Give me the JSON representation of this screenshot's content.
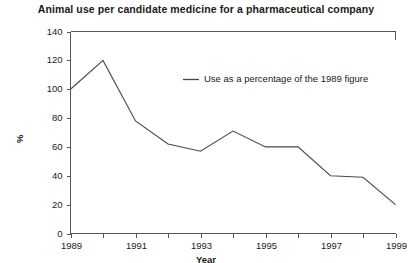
{
  "chart_data": {
    "type": "line",
    "title": "Animal use per candidate medicine for a pharmaceutical company",
    "xlabel": "Year",
    "ylabel": "%",
    "x": [
      1989,
      1990,
      1991,
      1992,
      1993,
      1994,
      1995,
      1996,
      1997,
      1998,
      1999
    ],
    "series": [
      {
        "name": "Use as a percentage of the 1989 figure",
        "values": [
          100,
          120,
          78,
          62,
          57,
          71,
          60,
          60,
          40,
          39,
          20
        ]
      }
    ],
    "xlim": [
      1989,
      1999
    ],
    "ylim": [
      0,
      140
    ],
    "yticks": [
      0,
      20,
      40,
      60,
      80,
      100,
      120,
      140
    ],
    "ytick_labels": [
      "0",
      "20",
      "40",
      "60",
      "80",
      "100",
      "120",
      "140"
    ],
    "xticks": [
      1989,
      1990,
      1991,
      1992,
      1993,
      1994,
      1995,
      1996,
      1997,
      1998,
      1999
    ],
    "xtick_labels": [
      "1989",
      "",
      "1991",
      "",
      "1993",
      "",
      "1995",
      "",
      "1997",
      "",
      "1999"
    ],
    "grid": false,
    "legend_position": "upper-center-right",
    "line_color": "#4a4a4a",
    "axis_color": "#555555",
    "background_color": "#ffffff"
  },
  "legend": {
    "entries": [
      {
        "label": "Use as a percentage of the 1989 figure",
        "color": "#4a4a4a"
      }
    ]
  }
}
